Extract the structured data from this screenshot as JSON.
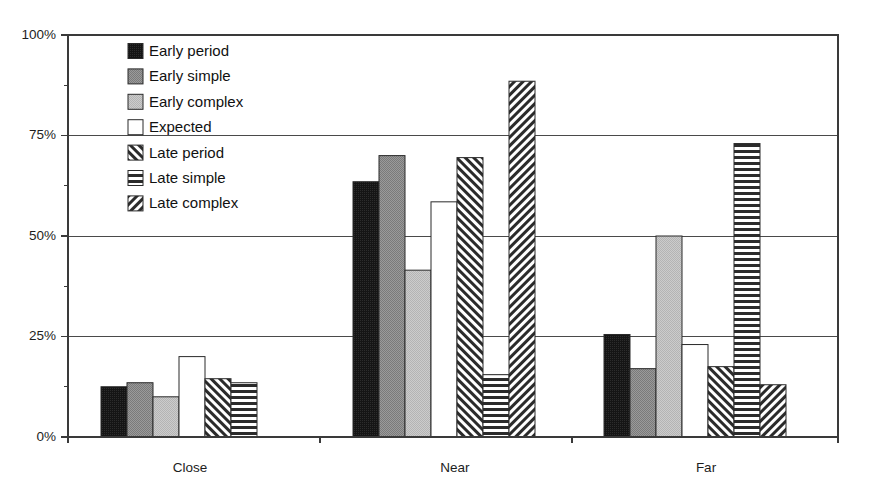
{
  "chart_data": {
    "type": "bar",
    "title": "",
    "subtitle": "",
    "xlabel": "",
    "ylabel": "",
    "categories": [
      "Close",
      "Near",
      "Far"
    ],
    "ylim": [
      0,
      100
    ],
    "yticks": [
      0,
      25,
      50,
      75,
      100
    ],
    "ytick_labels": [
      "0%",
      "25%",
      "50%",
      "75%",
      "100%"
    ],
    "grid": "horizontal",
    "legend_position": "inside-top-left",
    "value_unit": "percent",
    "series": [
      {
        "name": "Early period",
        "pattern": "solid-black",
        "values": [
          12.5,
          63.5,
          25.5
        ]
      },
      {
        "name": "Early simple",
        "pattern": "medium-gray",
        "values": [
          13.5,
          70.0,
          17.0
        ]
      },
      {
        "name": "Early complex",
        "pattern": "light-gray",
        "values": [
          10.0,
          41.5,
          50.0
        ]
      },
      {
        "name": "Expected",
        "pattern": "white",
        "values": [
          20.0,
          58.5,
          23.0
        ]
      },
      {
        "name": "Late period",
        "pattern": "diagonal-up",
        "values": [
          14.5,
          69.5,
          17.5
        ]
      },
      {
        "name": "Late simple",
        "pattern": "horizontal-lines",
        "values": [
          13.5,
          15.5,
          73.0
        ]
      },
      {
        "name": "Late complex",
        "pattern": "diagonal-down",
        "values": [
          0.0,
          88.5,
          13.0
        ]
      }
    ]
  },
  "legend": {
    "items": [
      {
        "label": "Early period"
      },
      {
        "label": "Early simple"
      },
      {
        "label": "Early complex"
      },
      {
        "label": "Expected"
      },
      {
        "label": "Late period"
      },
      {
        "label": "Late simple"
      },
      {
        "label": "Late complex"
      }
    ]
  },
  "axes": {
    "y": {
      "labels": [
        "100%",
        "75%",
        "50%",
        "25%",
        "0%"
      ]
    },
    "x": {
      "labels": [
        "Close",
        "Near",
        "Far"
      ]
    }
  },
  "colors": {
    "solid_black": "#151515",
    "medium_gray": "#8d8d8d",
    "light_gray": "#c2c2c2",
    "white": "#ffffff",
    "outline": "#2a2a2a",
    "grid": "#4a4a4a",
    "text": "#1a1a1a"
  }
}
